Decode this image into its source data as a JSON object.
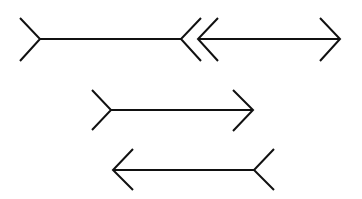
{
  "colors": {
    "line": "#111111",
    "background": "#ffffff"
  },
  "figures": [
    {
      "id": "top-left",
      "shaft": "horizontal line",
      "left_end": "fins-out",
      "right_end": "arrowhead-left"
    },
    {
      "id": "top-right",
      "shaft": "horizontal line",
      "left_end": "arrowhead-left",
      "right_end": "arrowhead-right"
    },
    {
      "id": "middle",
      "shaft": "horizontal line",
      "left_end": "fins-out",
      "right_end": "arrowhead-right"
    },
    {
      "id": "bottom",
      "shaft": "horizontal line",
      "left_end": "arrowhead-left",
      "right_end": "fins-out"
    }
  ]
}
